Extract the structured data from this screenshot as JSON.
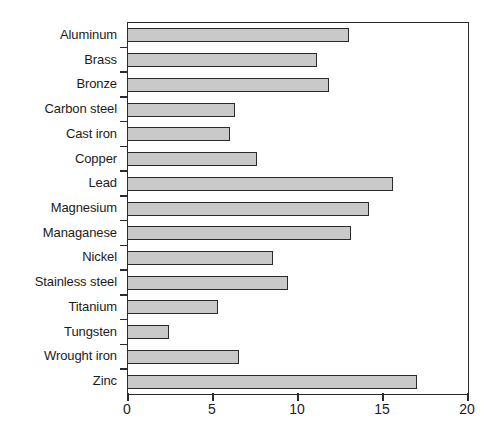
{
  "chart_data": {
    "type": "bar",
    "orientation": "horizontal",
    "title": "",
    "subtitle": "",
    "xlabel": "",
    "ylabel": "",
    "xlim": [
      0,
      20
    ],
    "xticks": [
      "0",
      "5",
      "10",
      "15",
      "20"
    ],
    "grid": false,
    "legend": null,
    "categories": [
      "Aluminum",
      "Brass",
      "Bronze",
      "Carbon steel",
      "Cast iron",
      "Copper",
      "Lead",
      "Magnesium",
      "Managanese",
      "Nickel",
      "Stainless steel",
      "Titanium",
      "Tungsten",
      "Wrought iron",
      "Zinc"
    ],
    "values": [
      13.0,
      11.1,
      11.8,
      6.3,
      6.0,
      7.6,
      15.6,
      14.2,
      13.1,
      8.5,
      9.4,
      5.3,
      2.4,
      6.5,
      17.0
    ],
    "colors": {
      "bar_fill": "#c9c9c9",
      "bar_border": "#2a2a2a",
      "axis": "#2b2b2b",
      "text": "#1b1b1b",
      "background": "#ffffff"
    }
  }
}
